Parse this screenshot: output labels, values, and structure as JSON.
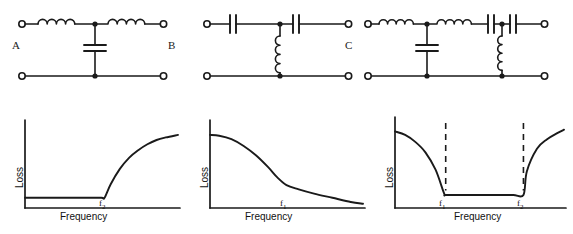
{
  "figure": {
    "background_color": "#ffffff",
    "line_color": "#1a1a1a",
    "width": 573,
    "height": 234
  },
  "circuits": [
    {
      "id": "A",
      "label": "A",
      "type": "low-pass-filter",
      "series_elements": [
        "inductor",
        "inductor"
      ],
      "shunt_elements": [
        "capacitor"
      ]
    },
    {
      "id": "B",
      "label": "B",
      "type": "high-pass-filter",
      "series_elements": [
        "capacitor",
        "capacitor"
      ],
      "shunt_elements": [
        "inductor"
      ]
    },
    {
      "id": "C",
      "label": "C",
      "type": "band-pass-filter",
      "series_elements": [
        "inductor",
        "inductor",
        "capacitor",
        "capacitor"
      ],
      "shunt_elements": [
        "capacitor",
        "inductor"
      ]
    }
  ],
  "chart_data": [
    {
      "type": "line",
      "title": "",
      "xlabel": "Frequency",
      "ylabel": "Loss",
      "response": "low-pass",
      "tick_labels": [
        {
          "text": "f",
          "sub": "2",
          "x_fraction": 0.52
        }
      ],
      "grid": false,
      "legend": null,
      "x": [
        0.0,
        0.1,
        0.2,
        0.3,
        0.4,
        0.5,
        0.52,
        0.56,
        0.62,
        0.68,
        0.74,
        0.8,
        0.86,
        0.92,
        1.0
      ],
      "y": [
        0.12,
        0.12,
        0.12,
        0.12,
        0.12,
        0.12,
        0.12,
        0.28,
        0.46,
        0.59,
        0.68,
        0.75,
        0.8,
        0.83,
        0.86
      ],
      "xlim": [
        0,
        1
      ],
      "ylim": [
        0,
        1
      ],
      "dashed_markers": []
    },
    {
      "type": "line",
      "title": "",
      "xlabel": "Frequency",
      "ylabel": "Loss",
      "response": "high-pass",
      "tick_labels": [
        {
          "text": "f",
          "sub": "1",
          "x_fraction": 0.5
        }
      ],
      "grid": false,
      "legend": null,
      "x": [
        0.0,
        0.06,
        0.14,
        0.22,
        0.3,
        0.38,
        0.44,
        0.5,
        0.58,
        0.68,
        0.8,
        0.92,
        1.0
      ],
      "y": [
        0.86,
        0.85,
        0.81,
        0.73,
        0.62,
        0.48,
        0.36,
        0.27,
        0.22,
        0.17,
        0.12,
        0.07,
        0.05
      ],
      "xlim": [
        0,
        1
      ],
      "ylim": [
        0,
        1
      ],
      "dashed_markers": []
    },
    {
      "type": "line",
      "title": "",
      "xlabel": "Frequency",
      "ylabel": "Loss",
      "response": "band-pass",
      "tick_labels": [
        {
          "text": "f",
          "sub": "1",
          "x_fraction": 0.3
        },
        {
          "text": "f",
          "sub": "2",
          "x_fraction": 0.76
        }
      ],
      "grid": false,
      "legend": null,
      "x": [
        0.0,
        0.06,
        0.12,
        0.18,
        0.24,
        0.29,
        0.3,
        0.4,
        0.5,
        0.6,
        0.7,
        0.76,
        0.78,
        0.84,
        0.9,
        0.96,
        1.0
      ],
      "y": [
        0.88,
        0.84,
        0.76,
        0.64,
        0.44,
        0.17,
        0.15,
        0.15,
        0.15,
        0.15,
        0.15,
        0.15,
        0.42,
        0.68,
        0.79,
        0.86,
        0.9
      ],
      "xlim": [
        0,
        1
      ],
      "ylim": [
        0,
        1
      ],
      "dashed_markers": [
        0.3,
        0.76
      ]
    }
  ]
}
